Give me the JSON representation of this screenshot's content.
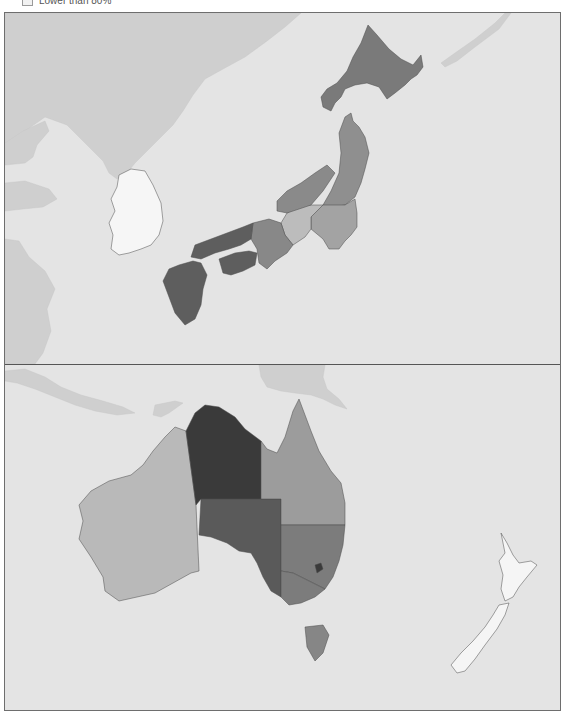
{
  "legend": {
    "items": [
      {
        "label": "Lower than 80%",
        "color": "#f2f2f2"
      }
    ]
  },
  "colors": {
    "sea": "#e4e4e4",
    "other_land": "#cfcfcf",
    "frame": "#6e6e6e",
    "divider": "#555555"
  },
  "panels": [
    {
      "name": "east-asia",
      "other_land": [
        {
          "name": "asia-mainland-north",
          "points": "0,0 296,0 280,14 262,28 240,44 218,56 200,66 188,82 178,98 168,112 152,128 140,140 130,150 122,160 112,166 104,160 98,148 80,130 62,112 40,104 20,118 8,130 0,132"
        },
        {
          "name": "liaodong-peninsula",
          "points": "0,130 18,118 40,108 44,118 32,132 28,144 20,150 0,152"
        },
        {
          "name": "shandong-peninsula",
          "points": "0,170 20,168 44,176 52,186 38,194 18,196 0,198"
        },
        {
          "name": "china-east",
          "points": "0,226 14,228 24,244 40,258 50,276 42,296 46,318 38,340 30,351 0,351"
        },
        {
          "name": "kuril-islands",
          "points": "500,0 506,0 494,16 470,34 452,48 440,54 436,50 450,40 470,26 490,10"
        }
      ],
      "regions": [
        {
          "name": "south-korea",
          "fill": "#f6f6f6",
          "points": "114,162 126,156 140,158 148,172 156,190 158,208 154,222 146,232 136,236 124,240 114,242 106,236 108,222 104,210 110,198 106,186 112,174"
        },
        {
          "name": "hokkaido",
          "fill": "#7a7a7a",
          "points": "363,12 372,22 384,36 396,46 408,52 416,42 418,54 412,62 406,66 400,72 390,80 382,86 374,74 362,70 350,72 340,76 336,84 330,90 326,98 318,94 316,84 322,76 332,70 342,58 348,44 356,30"
        },
        {
          "name": "tohoku",
          "fill": "#8f8f8f",
          "points": "340,104 346,100 348,108 354,114 360,124 364,140 360,156 356,170 350,184 340,192 326,194 318,192 326,178 334,160 336,140 334,120"
        },
        {
          "name": "kanto",
          "fill": "#a3a3a3",
          "points": "318,192 340,192 350,186 352,200 352,214 346,222 340,228 334,236 324,236 318,226 306,216 306,204"
        },
        {
          "name": "chubu",
          "fill": "#bcbcbc",
          "points": "282,200 296,192 306,192 318,192 306,204 306,216 300,224 288,232 280,222 276,210"
        },
        {
          "name": "hokuriku",
          "fill": "#8a8a8a",
          "points": "272,188 282,178 296,170 310,160 322,152 330,160 318,178 306,192 282,200 272,198"
        },
        {
          "name": "kinki",
          "fill": "#888888",
          "points": "248,210 264,206 276,210 280,222 288,232 282,240 270,248 262,256 254,250 252,236 246,226"
        },
        {
          "name": "chugoku",
          "fill": "#5e5e5e",
          "points": "190,232 206,226 222,220 238,214 248,210 246,226 236,232 224,236 210,240 196,246 186,244"
        },
        {
          "name": "shikoku",
          "fill": "#5e5e5e",
          "points": "214,246 230,240 244,238 252,240 250,252 238,258 226,262 218,260"
        },
        {
          "name": "kyushu",
          "fill": "#5e5e5e",
          "points": "174,252 188,248 196,250 202,262 198,276 196,292 190,306 180,312 170,300 164,284 158,268 164,256"
        }
      ]
    },
    {
      "name": "oceania",
      "other_land": [
        {
          "name": "indonesia-islands",
          "points": "0,6 20,4 40,12 56,22 76,30 98,36 118,42 130,48 112,50 90,46 70,40 50,32 30,24 12,18 0,16"
        },
        {
          "name": "timor",
          "points": "150,40 170,36 178,38 164,48 156,52 148,50"
        },
        {
          "name": "new-guinea",
          "points": "254,0 320,0 318,12 322,24 334,34 342,44 330,40 318,34 306,30 290,28 276,26 262,22 256,12"
        }
      ],
      "regions": [
        {
          "name": "western-australia",
          "fill": "#b9b9b9",
          "points": "181,66 170,62 160,72 148,86 138,100 126,110 104,116 86,126 74,140 78,156 74,174 86,192 98,212 100,226 114,236 132,232 150,228 168,218 186,208 194,206 191,140"
        },
        {
          "name": "northern-territory",
          "fill": "#3a3a3a",
          "points": "181,66 190,48 200,40 214,42 230,52 240,64 256,76 256,134 196,134 191,140"
        },
        {
          "name": "south-australia",
          "fill": "#5a5a5a",
          "points": "196,134 276,134 276,232 266,226 258,212 252,198 246,188 234,186 222,178 206,172 194,170"
        },
        {
          "name": "queensland",
          "fill": "#9c9c9c",
          "points": "256,76 262,84 272,88 280,72 288,46 294,34 300,50 306,66 314,86 326,106 336,118 340,138 340,160 276,160 276,134 256,134"
        },
        {
          "name": "new-south-wales",
          "fill": "#7c7c7c",
          "points": "276,160 340,160 338,180 334,196 328,212 320,224 312,220 300,214 288,208 276,206"
        },
        {
          "name": "victoria",
          "fill": "#7c7c7c",
          "points": "276,206 288,208 300,214 312,220 320,224 310,232 296,238 284,240 276,232"
        },
        {
          "name": "act",
          "fill": "#3a3a3a",
          "points": "310,200 316,198 318,204 312,208"
        },
        {
          "name": "tasmania",
          "fill": "#868686",
          "points": "300,262 318,260 324,270 318,288 310,296 302,282"
        },
        {
          "name": "new-zealand-north",
          "fill": "#f5f5f5",
          "points": "496,168 502,178 508,190 514,198 526,196 532,200 522,212 514,222 508,232 500,236 496,224 498,210 494,196 500,188"
        },
        {
          "name": "new-zealand-south",
          "fill": "#f5f5f5",
          "points": "494,240 504,238 500,250 492,264 480,280 470,294 460,306 452,308 446,300 456,288 468,276 480,262 488,250"
        }
      ]
    }
  ]
}
